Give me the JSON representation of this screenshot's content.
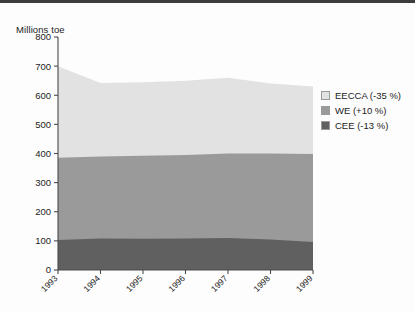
{
  "chart_data": {
    "type": "area",
    "stacked": true,
    "title": "",
    "subtitle": "",
    "xlabel": "",
    "ylabel": "Millions toe",
    "categories": [
      "1993",
      "1994",
      "1995",
      "1996",
      "1997",
      "1998",
      "1999"
    ],
    "x": [
      1993,
      1994,
      1995,
      1996,
      1997,
      1998,
      1999
    ],
    "ylim": [
      0,
      800
    ],
    "yticks": [
      0,
      100,
      200,
      300,
      400,
      500,
      600,
      700,
      800
    ],
    "ytick_labels": [
      "0",
      "100",
      "200",
      "300",
      "400",
      "500",
      "600",
      "700",
      "800"
    ],
    "grid": false,
    "legend_position": "right",
    "series": [
      {
        "name": "CEE (-13 %)",
        "key": "CEE",
        "color": "#606060",
        "stack_order": 1,
        "values": [
          103,
          108,
          107,
          108,
          110,
          105,
          96
        ]
      },
      {
        "name": "WE (+10 %)",
        "key": "WE",
        "color": "#9a9a9a",
        "stack_order": 2,
        "values": [
          282,
          282,
          285,
          287,
          290,
          295,
          302
        ]
      },
      {
        "name": "EECCA (-35 %)",
        "key": "EECCA",
        "color": "#e2e2e2",
        "stack_order": 3,
        "values": [
          315,
          252,
          253,
          255,
          260,
          240,
          232
        ]
      }
    ],
    "cumulative_tops": {
      "CEE": [
        103,
        108,
        107,
        108,
        110,
        105,
        96
      ],
      "WE": [
        385,
        390,
        392,
        395,
        400,
        400,
        398
      ],
      "EECCA": [
        700,
        642,
        645,
        650,
        660,
        640,
        630
      ]
    },
    "totals": [
      700,
      642,
      645,
      650,
      660,
      640,
      630
    ]
  },
  "legend": {
    "items": [
      {
        "label": "EECCA (-35 %)",
        "color": "#e2e2e2"
      },
      {
        "label": "WE (+10 %)",
        "color": "#9a9a9a"
      },
      {
        "label": "CEE (-13 %)",
        "color": "#606060"
      }
    ]
  },
  "axis": {
    "y_title": "Millions toe"
  },
  "colors": {
    "eecca": "#e2e2e2",
    "we": "#9a9a9a",
    "cee": "#606060",
    "axis": "#4a4a4a",
    "text": "#1c1c1c",
    "background": "#fdfdfd",
    "top_border": "#3d3d3d"
  }
}
